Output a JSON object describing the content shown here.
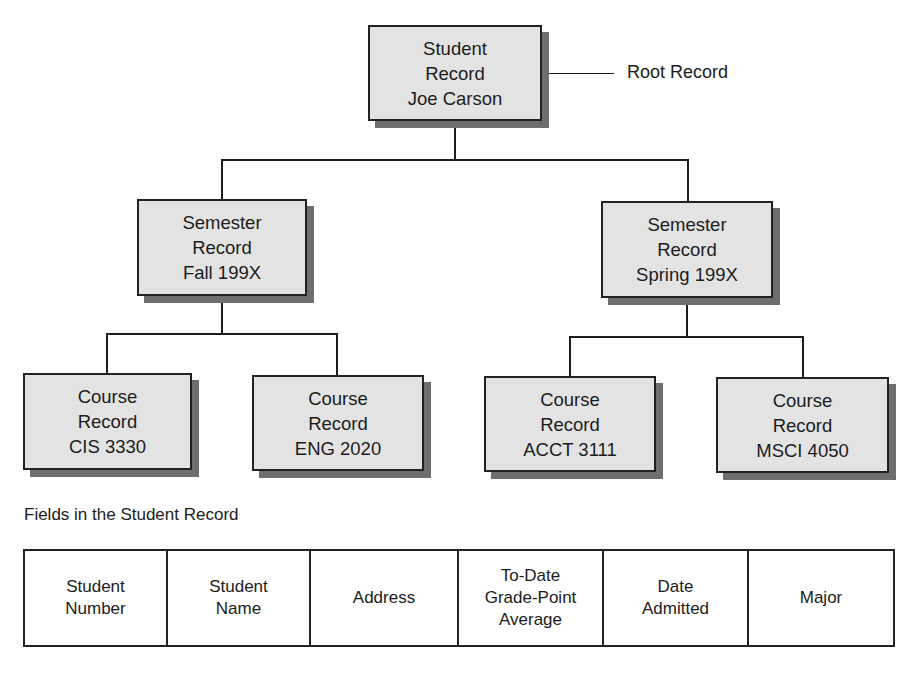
{
  "diagram": {
    "root": {
      "lines": [
        "Student",
        "Record",
        "Joe Carson"
      ],
      "annotation": "Root Record"
    },
    "semesters": [
      {
        "lines": [
          "Semester",
          "Record",
          "Fall 199X"
        ],
        "courses": [
          {
            "lines": [
              "Course",
              "Record",
              "CIS 3330"
            ]
          },
          {
            "lines": [
              "Course",
              "Record",
              "ENG 2020"
            ]
          }
        ]
      },
      {
        "lines": [
          "Semester",
          "Record",
          "Spring 199X"
        ],
        "courses": [
          {
            "lines": [
              "Course",
              "Record",
              "ACCT 3111"
            ]
          },
          {
            "lines": [
              "Course",
              "Record",
              "MSCI 4050"
            ]
          }
        ]
      }
    ]
  },
  "fields": {
    "caption": "Fields in the Student Record",
    "columns": [
      {
        "lines": [
          "Student",
          "Number"
        ]
      },
      {
        "lines": [
          "Student",
          "Name"
        ]
      },
      {
        "lines": [
          "Address"
        ]
      },
      {
        "lines": [
          "To-Date",
          "Grade-Point",
          "Average"
        ]
      },
      {
        "lines": [
          "Date",
          "Admitted"
        ]
      },
      {
        "lines": [
          "Major"
        ]
      }
    ]
  },
  "colors": {
    "box_fill": "#e3e3e3",
    "shadow": "#6e6e6e",
    "stroke": "#222222"
  }
}
